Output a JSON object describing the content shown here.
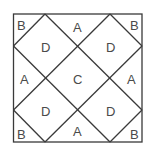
{
  "diagram": {
    "labels": {
      "top_left": "B",
      "top_center": "A",
      "top_right": "B",
      "upper_left_diamond": "D",
      "upper_right_diamond": "D",
      "middle_left": "A",
      "center": "C",
      "middle_right": "A",
      "lower_left_diamond": "D",
      "lower_right_diamond": "D",
      "bottom_left": "B",
      "bottom_center": "A",
      "bottom_right": "B"
    },
    "colors": {
      "line": "#3a3a3a",
      "text": "#4a4a4a",
      "background": "#ffffff"
    }
  }
}
